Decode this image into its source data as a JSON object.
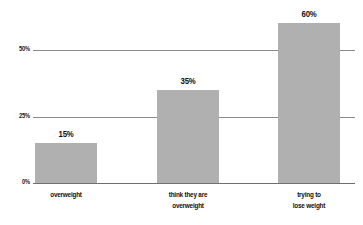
{
  "chart_data": {
    "type": "bar",
    "title": "",
    "subtitle": "",
    "xlabel": "",
    "ylabel": "",
    "categories": [
      "overweight",
      "think they are overweight",
      "trying to lose weight"
    ],
    "category_lines": [
      [
        "overweight"
      ],
      [
        "think they are",
        "overweight"
      ],
      [
        "trying to",
        "lose weight"
      ]
    ],
    "values": [
      15,
      35,
      60
    ],
    "value_labels": [
      "15%",
      "35%",
      "60%"
    ],
    "ylim": [
      0,
      62
    ],
    "yticks": [
      0,
      25,
      50
    ],
    "ytick_labels": [
      "0%",
      "25%",
      "50%"
    ],
    "grid": true,
    "legend": false,
    "legend_position": "none",
    "bar_color": "#b0b0b0",
    "axis_color": "#6f6f6f",
    "grid_color": "#8a8a8a",
    "text_color": "#111111"
  }
}
